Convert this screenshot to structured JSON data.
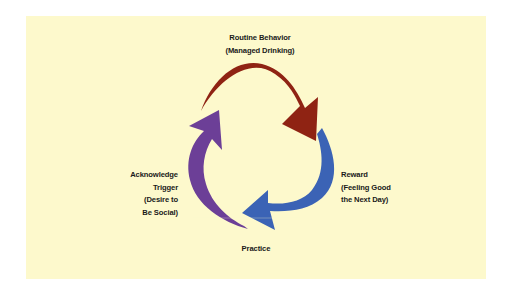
{
  "diagram": {
    "type": "habit-loop-cycle",
    "nodes": [
      {
        "id": "routine",
        "label_line1": "Routine Behavior",
        "label_line2": "(Managed Drinking)",
        "arrow_color": "#8f2313"
      },
      {
        "id": "reward",
        "label_line1": "Reward",
        "label_line2": "(Feeling Good",
        "label_line3": "the Next Day)",
        "arrow_color": "#3b63b5"
      },
      {
        "id": "practice",
        "label_line1": "Practice"
      },
      {
        "id": "trigger",
        "label_line1": "Acknowledge",
        "label_line2": "Trigger",
        "label_line3": "(Desire to",
        "label_line4": "Be Social)",
        "arrow_color": "#6c3f97"
      }
    ],
    "edges": [
      {
        "from": "trigger",
        "to": "routine",
        "color": "#6c3f97"
      },
      {
        "from": "routine",
        "to": "reward",
        "color": "#8f2313"
      },
      {
        "from": "reward",
        "to": "trigger",
        "color": "#3b63b5"
      }
    ],
    "background": "#fdf9cc"
  }
}
